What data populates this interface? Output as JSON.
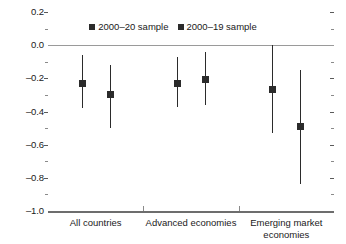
{
  "chart_data": {
    "type": "scatter",
    "title": "",
    "subtitle": "",
    "xlabel": "",
    "ylabel": "",
    "ylim": [
      -1.0,
      0.2
    ],
    "ytick_labels": [
      "0.2",
      "0.0",
      "–0.2",
      "–0.4",
      "–0.6",
      "–0.8",
      "–1.0"
    ],
    "ytick_values": [
      0.2,
      0.0,
      -0.2,
      -0.4,
      -0.6,
      -0.8,
      -1.0
    ],
    "yminor_values": [
      0.1,
      -0.1,
      -0.3,
      -0.5,
      -0.7,
      -0.9
    ],
    "grid": false,
    "zero_line": 0.0,
    "legend_position": "top-center",
    "categories": [
      "All countries",
      "Advanced economies",
      "Emerging market economies"
    ],
    "series": [
      {
        "name": "2000–20 sample",
        "marker": "square",
        "color": "#2b2b2b",
        "values": [
          -0.23,
          -0.23,
          -0.27
        ],
        "ci_low": [
          -0.38,
          -0.37,
          -0.53
        ],
        "ci_high": [
          -0.06,
          -0.07,
          0.0
        ]
      },
      {
        "name": "2000–19 sample",
        "marker": "square",
        "color": "#2b2b2b",
        "values": [
          -0.3,
          -0.21,
          -0.49
        ],
        "ci_low": [
          -0.5,
          -0.36,
          -0.84
        ],
        "ci_high": [
          -0.12,
          -0.04,
          -0.15
        ]
      }
    ],
    "legend": [
      "2000–20 sample",
      "2000–19 sample"
    ]
  },
  "axis": {
    "ticks": [
      {
        "label": "0.2",
        "value": 0.2
      },
      {
        "label": "0.0",
        "value": 0.0
      },
      {
        "label": "–0.2",
        "value": -0.2
      },
      {
        "label": "–0.4",
        "value": -0.4
      },
      {
        "label": "–0.6",
        "value": -0.6
      },
      {
        "label": "–0.8",
        "value": -0.8
      },
      {
        "label": "–1.0",
        "value": -1.0
      }
    ]
  },
  "categories": [
    {
      "label": "All countries",
      "line2": ""
    },
    {
      "label": "Advanced economies",
      "line2": ""
    },
    {
      "label": "Emerging market",
      "line2": "economies"
    }
  ],
  "legend": {
    "items": [
      {
        "label": "2000–20 sample",
        "color": "#2b2b2b"
      },
      {
        "label": "2000–19 sample",
        "color": "#2b2b2b"
      }
    ]
  }
}
